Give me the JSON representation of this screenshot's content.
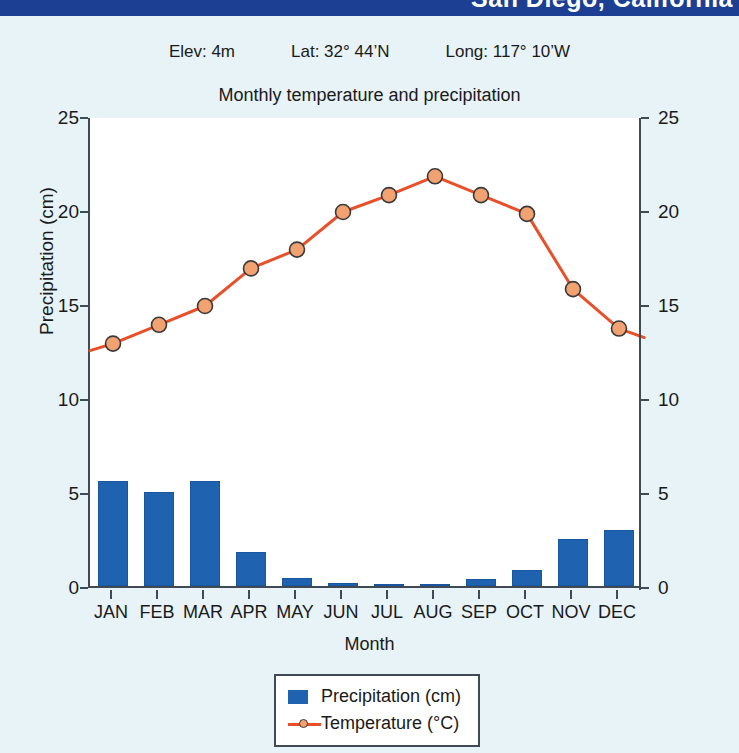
{
  "banner": {
    "text": "San Diego, California"
  },
  "header": {
    "elevation": "Elev: 4m",
    "latitude": "Lat: 32° 44’N",
    "longitude": "Long: 117° 10’W",
    "subtitle": "Monthly temperature and precipitation"
  },
  "legend": {
    "precipitation": "Precipitation (cm)",
    "temperature": "Temperature (°C)"
  },
  "colors": {
    "banner": "#1c3f94",
    "page_background": "#e7f3f7",
    "bar": "#1f62b0",
    "line": "#e8502a",
    "marker_fill": "#f2a170",
    "marker_edge": "#3a3a3a",
    "axis": "#3f4a55"
  },
  "chart_data": {
    "type": "bar",
    "title": "Monthly temperature and precipitation",
    "xlabel": "Month",
    "ylabel": "Precipitation (cm)",
    "ylabel_right": "Temperature (°C)",
    "ylim": [
      0,
      25
    ],
    "ylim_right": [
      0,
      25
    ],
    "yticks": [
      0,
      5,
      10,
      15,
      20,
      25
    ],
    "yticks_right": [
      0,
      5,
      10,
      15,
      20,
      25
    ],
    "grid": false,
    "legend_position": "bottom-center",
    "categories": [
      "JAN",
      "FEB",
      "MAR",
      "APR",
      "MAY",
      "JUN",
      "JUL",
      "AUG",
      "SEP",
      "OCT",
      "NOV",
      "DEC"
    ],
    "series": [
      {
        "name": "Precipitation (cm)",
        "type": "bar",
        "axis": "left",
        "values": [
          5.6,
          5.0,
          5.6,
          1.8,
          0.4,
          0.15,
          0.02,
          0.1,
          0.35,
          0.85,
          2.5,
          3.0
        ]
      },
      {
        "name": "Temperature (°C)",
        "type": "line",
        "axis": "right",
        "values": [
          13.0,
          14.0,
          15.0,
          17.0,
          18.0,
          20.0,
          20.9,
          21.9,
          20.9,
          19.9,
          15.9,
          13.8
        ]
      }
    ]
  }
}
